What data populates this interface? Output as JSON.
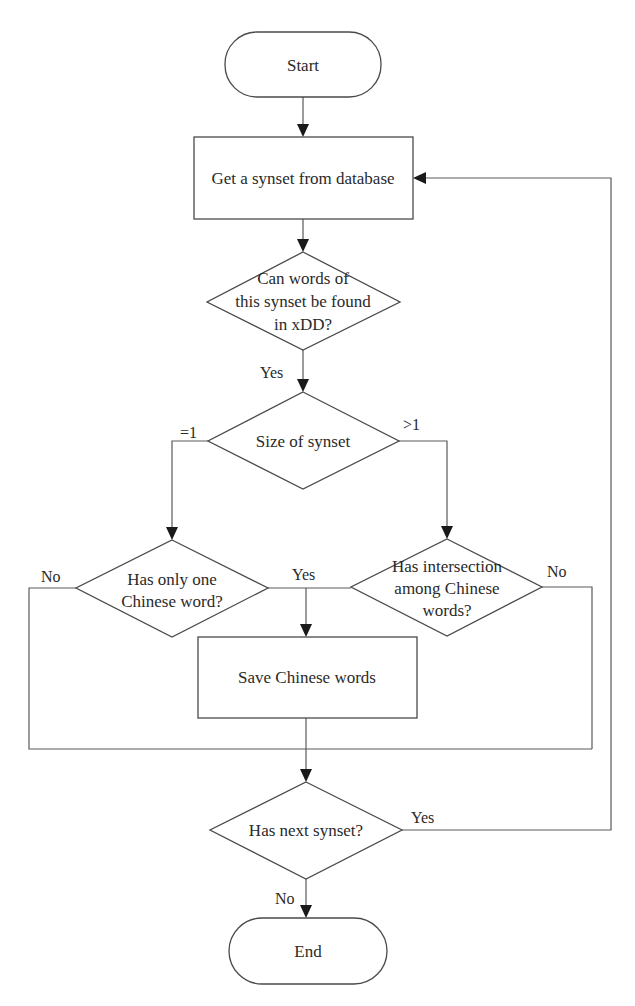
{
  "diagram": {
    "type": "flowchart",
    "nodes": {
      "start": {
        "shape": "terminator",
        "text": "Start"
      },
      "get_synset": {
        "shape": "process",
        "text": "Get a synset from database"
      },
      "can_find": {
        "shape": "decision",
        "lines": [
          "Can words of",
          "this synset be found",
          "in xDD?"
        ]
      },
      "size": {
        "shape": "decision",
        "text": "Size of synset"
      },
      "only_one": {
        "shape": "decision",
        "lines": [
          "Has only one",
          "Chinese word?"
        ]
      },
      "intersection": {
        "shape": "decision",
        "lines": [
          "Has intersection",
          "among Chinese",
          "words?"
        ]
      },
      "save": {
        "shape": "process",
        "text": "Save Chinese words"
      },
      "has_next": {
        "shape": "decision",
        "text": "Has next synset?"
      },
      "end": {
        "shape": "terminator",
        "text": "End"
      }
    },
    "edge_labels": {
      "can_find_yes": "Yes",
      "size_eq1": "=1",
      "size_gt1": ">1",
      "only_one_no": "No",
      "only_one_yes": "Yes",
      "intersection_no": "No",
      "has_next_yes": "Yes",
      "has_next_no": "No"
    },
    "edges": [
      {
        "from": "start",
        "to": "get_synset"
      },
      {
        "from": "get_synset",
        "to": "can_find"
      },
      {
        "from": "can_find",
        "to": "size",
        "label": "Yes"
      },
      {
        "from": "size",
        "to": "only_one",
        "label": "=1"
      },
      {
        "from": "size",
        "to": "intersection",
        "label": ">1"
      },
      {
        "from": "only_one",
        "to": "save",
        "label": "Yes"
      },
      {
        "from": "intersection",
        "to": "save",
        "label": "Yes"
      },
      {
        "from": "only_one",
        "to": "has_next",
        "label": "No"
      },
      {
        "from": "intersection",
        "to": "has_next",
        "label": "No"
      },
      {
        "from": "save",
        "to": "has_next"
      },
      {
        "from": "has_next",
        "to": "get_synset",
        "label": "Yes"
      },
      {
        "from": "has_next",
        "to": "end",
        "label": "No"
      }
    ]
  }
}
